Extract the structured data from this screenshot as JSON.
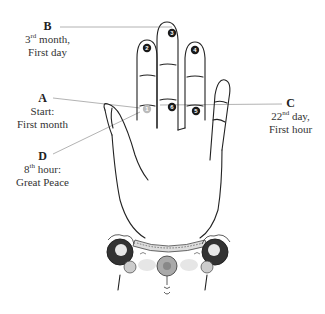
{
  "labels": {
    "A": {
      "key": "A",
      "line1": "Start:",
      "line2": "First month"
    },
    "B": {
      "key": "B",
      "line1_num": "3",
      "line1_sup": "rd",
      "line1_rest": " month,",
      "line2": "First day"
    },
    "C": {
      "key": "C",
      "line1_num": "22",
      "line1_sup": "nd",
      "line1_rest": " day,",
      "line2": "First hour"
    },
    "D": {
      "key": "D",
      "line1_num": "8",
      "line1_sup": "th",
      "line1_rest": " hour:",
      "line2": "Great Peace"
    }
  },
  "markers": [
    "1",
    "2",
    "3",
    "4",
    "5",
    "6"
  ],
  "colors": {
    "line": "#999999",
    "outline": "#222222",
    "marker": "#1a1a1a",
    "marker_start": "#bbbbbb"
  }
}
